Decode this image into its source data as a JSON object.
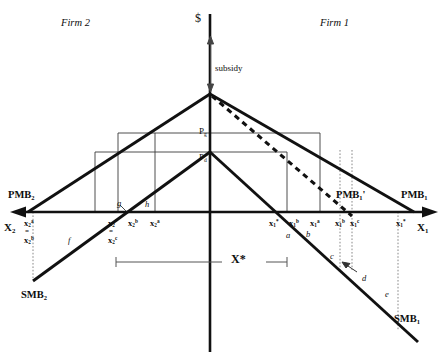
{
  "diagram": {
    "title_left": "Firm 2",
    "title_right": "Firm 1",
    "vertical_axis_label": "$",
    "axis_left_label": "X",
    "axis_left_sub": "2",
    "axis_right_label": "X",
    "axis_right_sub": "1",
    "subsidy_label": "subsidy",
    "price_gross": "P",
    "price_gross_sub": "g",
    "price_net": "P",
    "price_net_sub": "d",
    "xstar_label": "X*",
    "curves": [
      {
        "name": "pmb2",
        "label": "PMB",
        "sub": "2",
        "prime": ""
      },
      {
        "name": "smb2",
        "label": "SMB",
        "sub": "2",
        "prime": ""
      },
      {
        "name": "pmb1",
        "label": "PMB",
        "sub": "1",
        "prime": ""
      },
      {
        "name": "pmb1-prime",
        "label": "PMB",
        "sub": "1",
        "prime": "'"
      },
      {
        "name": "smb1",
        "label": "SMB",
        "sub": "1",
        "prime": ""
      }
    ],
    "ticks_left": [
      {
        "name": "x2-a-origin",
        "base": "x",
        "sub": "2",
        "sup": "a",
        "x": 24,
        "y": 219
      },
      {
        "name": "x2-b-origin",
        "base": "x",
        "sub": "2",
        "sup": "b",
        "x": 24,
        "y": 236
      },
      {
        "name": "x2-star",
        "base": "x",
        "sub": "2",
        "sup": "*",
        "x": 110,
        "y": 219
      },
      {
        "name": "x2-c",
        "base": "x",
        "sub": "2",
        "sup": "c",
        "x": 110,
        "y": 238
      },
      {
        "name": "x2-b",
        "base": "x",
        "sub": "2",
        "sup": "b",
        "x": 130,
        "y": 219
      },
      {
        "name": "x2-a",
        "base": "x",
        "sub": "2",
        "sup": "a",
        "x": 152,
        "y": 219
      }
    ],
    "ticks_right": [
      {
        "name": "x1-star",
        "base": "x",
        "sub": "1",
        "sup": "*",
        "x": 271,
        "y": 219
      },
      {
        "name": "x1-b",
        "base": "x",
        "sub": "1",
        "sup": "b",
        "x": 291,
        "y": 219
      },
      {
        "name": "x1-a",
        "base": "x",
        "sub": "1",
        "sup": "a",
        "x": 312,
        "y": 219
      },
      {
        "name": "x1-d",
        "base": "x",
        "sub": "1",
        "sup": "b",
        "x": 337,
        "y": 219
      },
      {
        "name": "x1-c",
        "base": "x",
        "sub": "1",
        "sup": "c",
        "x": 352,
        "y": 219
      },
      {
        "name": "x1-max",
        "base": "x",
        "sub": "1",
        "sup": "*",
        "x": 398,
        "y": 219
      }
    ],
    "equals_marker": "=",
    "area_labels": [
      {
        "name": "area-a",
        "text": "a",
        "x": 286,
        "y": 231
      },
      {
        "name": "area-b",
        "text": "b",
        "x": 306,
        "y": 230
      },
      {
        "name": "area-c",
        "text": "c",
        "x": 330,
        "y": 255
      },
      {
        "name": "area-d",
        "text": "d",
        "x": 362,
        "y": 277
      },
      {
        "name": "area-e",
        "text": "e",
        "x": 385,
        "y": 293
      },
      {
        "name": "area-f",
        "text": "f",
        "x": 68,
        "y": 239
      },
      {
        "name": "area-g",
        "text": "g",
        "x": 117,
        "y": 202
      },
      {
        "name": "area-h",
        "text": "h",
        "x": 145,
        "y": 203
      }
    ]
  }
}
